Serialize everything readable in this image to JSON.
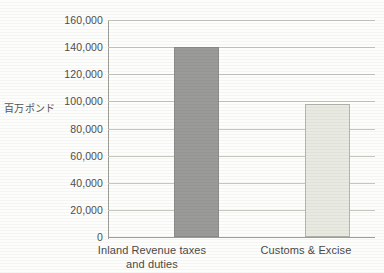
{
  "page": {
    "background_color": "#fdfdfb"
  },
  "title_strip": {
    "text": "",
    "note": "clipped at top edge, illegible"
  },
  "chart_data": {
    "type": "bar",
    "title": "",
    "xlabel": "",
    "ylabel": "百万ポンド",
    "categories": [
      "Inland Revenue taxes and duties",
      "Customs & Excise"
    ],
    "category_lines": [
      [
        "Inland Revenue taxes",
        "and duties"
      ],
      [
        "Customs & Excise",
        ""
      ]
    ],
    "values": [
      140000,
      98000
    ],
    "ylim": [
      0,
      160000
    ],
    "ytick_values": [
      0,
      20000,
      40000,
      60000,
      80000,
      100000,
      120000,
      140000,
      160000
    ],
    "ytick_labels": [
      "0",
      "20,000",
      "40,000",
      "60,000",
      "80,000",
      "100,000",
      "120,000",
      "140,000",
      "160,000"
    ],
    "grid": true,
    "legend": "none",
    "bar_colors": [
      "#9a9a99",
      "#e8e9e0"
    ],
    "bar_border_colors": [
      "#8c8c8a",
      "#b4b5ab"
    ]
  },
  "colors": {
    "gridline": "#c6c6c0",
    "axis": "#9d9d98",
    "text": "#4a4a48"
  }
}
